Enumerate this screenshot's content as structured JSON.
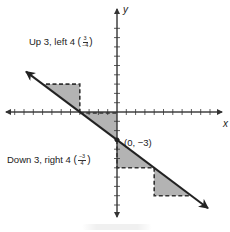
{
  "axes": {
    "x_label": "x",
    "y_label": "y",
    "tick_spacing_units": 1
  },
  "line": {
    "slope": "-3/4",
    "y_intercept": -3,
    "point_label": "(0, −3)"
  },
  "annotations": {
    "up_left": {
      "text": "Up 3, left 4",
      "frac_num": "3",
      "frac_den": "−4"
    },
    "down_right": {
      "text": "Down 3, right 4",
      "frac_num": "−3",
      "frac_den": "4"
    }
  },
  "slope_triangles": [
    {
      "vertices": [
        [
          -8,
          3
        ],
        [
          -4,
          3
        ],
        [
          -4,
          0
        ]
      ],
      "direction": "up 3, left 4"
    },
    {
      "vertices": [
        [
          -4,
          0
        ],
        [
          0,
          0
        ],
        [
          0,
          -3
        ]
      ],
      "direction": "reference"
    },
    {
      "vertices": [
        [
          0,
          -3
        ],
        [
          0,
          -6
        ],
        [
          4,
          -6
        ]
      ],
      "direction": "down 3, right 4"
    },
    {
      "vertices": [
        [
          4,
          -6
        ],
        [
          4,
          -9
        ],
        [
          8,
          -9
        ]
      ],
      "direction": "down 3, right 4"
    }
  ],
  "colors": {
    "line": "#222222",
    "shade": "#b3b3b3",
    "axis": "#333333"
  }
}
